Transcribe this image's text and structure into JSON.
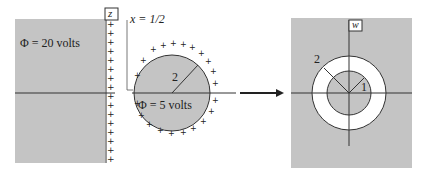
{
  "left_diagram": {
    "plane_label": "z",
    "region_label": "Φ = 20 volts",
    "line_label": "x = 1/2",
    "circle_label": "Φ = 5 volts",
    "radius_label": "2",
    "charge_symbol": "+"
  },
  "right_diagram": {
    "plane_label": "w",
    "outer_radius_label": "2",
    "inner_radius_label": "1"
  },
  "colors": {
    "fill_gray": "#c4c4c4",
    "line": "#333333",
    "ring": "#ffffff"
  }
}
